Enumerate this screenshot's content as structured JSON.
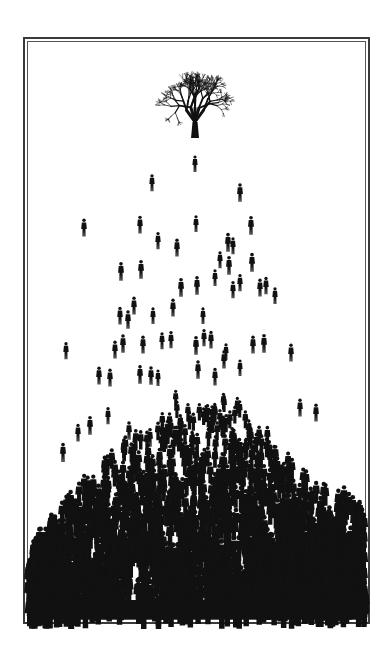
{
  "artwork": {
    "subject": "tree above crowd of people silhouettes",
    "colors": {
      "background": "#ffffff",
      "ink": "#111111",
      "frame": "#3a3a3a"
    },
    "frame": {
      "outer": [
        23,
        37,
        369,
        623
      ],
      "inner_offset": 4
    },
    "tree": {
      "cx": 195,
      "base_y": 138,
      "canopy_top": 75,
      "canopy_width": 80
    },
    "sparse_figures": [
      [
        195,
        166
      ],
      [
        152,
        185
      ],
      [
        240,
        195
      ],
      [
        84,
        230
      ],
      [
        140,
        227
      ],
      [
        196,
        226
      ],
      [
        251,
        228
      ],
      [
        158,
        243
      ],
      [
        177,
        250
      ],
      [
        228,
        245
      ],
      [
        252,
        265
      ],
      [
        220,
        262
      ],
      [
        233,
        248
      ],
      [
        229,
        268
      ],
      [
        121,
        274
      ],
      [
        141,
        272
      ],
      [
        266,
        288
      ],
      [
        275,
        298
      ],
      [
        260,
        290
      ],
      [
        240,
        285
      ],
      [
        181,
        290
      ],
      [
        197,
        288
      ],
      [
        215,
        280
      ],
      [
        233,
        292
      ],
      [
        120,
        318
      ],
      [
        128,
        322
      ],
      [
        134,
        308
      ],
      [
        153,
        318
      ],
      [
        173,
        310
      ],
      [
        203,
        318
      ],
      [
        204,
        340
      ],
      [
        115,
        352
      ],
      [
        123,
        346
      ],
      [
        143,
        347
      ],
      [
        162,
        343
      ],
      [
        171,
        342
      ],
      [
        196,
        348
      ],
      [
        211,
        342
      ],
      [
        226,
        354
      ],
      [
        253,
        347
      ],
      [
        264,
        346
      ],
      [
        66,
        353
      ],
      [
        291,
        355
      ],
      [
        99,
        378
      ],
      [
        110,
        380
      ],
      [
        140,
        377
      ],
      [
        151,
        378
      ],
      [
        158,
        380
      ],
      [
        198,
        372
      ],
      [
        224,
        362
      ],
      [
        215,
        379
      ],
      [
        316,
        415
      ],
      [
        63,
        455
      ],
      [
        78,
        435
      ],
      [
        90,
        428
      ],
      [
        108,
        418
      ],
      [
        129,
        433
      ],
      [
        150,
        440
      ],
      [
        180,
        430
      ],
      [
        240,
        370
      ],
      [
        300,
        410
      ]
    ],
    "crowd": {
      "profile": [
        [
          28,
          560
        ],
        [
          45,
          535
        ],
        [
          70,
          500
        ],
        [
          95,
          470
        ],
        [
          120,
          450
        ],
        [
          150,
          420
        ],
        [
          175,
          400
        ],
        [
          195,
          395
        ],
        [
          220,
          400
        ],
        [
          245,
          410
        ],
        [
          270,
          440
        ],
        [
          295,
          470
        ],
        [
          320,
          495
        ],
        [
          345,
          500
        ],
        [
          366,
          515
        ]
      ],
      "solid_region": [
        [
          262,
          545
        ],
        [
          366,
          530
        ],
        [
          366,
          619
        ],
        [
          262,
          619
        ]
      ]
    }
  }
}
